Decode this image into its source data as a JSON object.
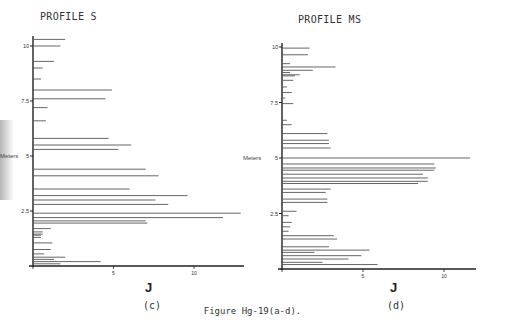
{
  "figure": {
    "caption": "Figure Hg-19(a-d).",
    "panels": [
      {
        "id": "c",
        "title": "PROFILE S",
        "sublabel": "(c)",
        "ylabel": "Meters",
        "xlabel": "J"
      },
      {
        "id": "d",
        "title": "PROFILE MS",
        "sublabel": "(d)",
        "ylabel": "Meters",
        "xlabel": "J"
      }
    ]
  },
  "chart_data": [
    {
      "type": "bar",
      "orientation": "horizontal",
      "title": "PROFILE S",
      "panel_label": "(c)",
      "xlabel": "J",
      "ylabel": "Meters",
      "xlim": [
        0,
        13
      ],
      "ylim": [
        0,
        10.5
      ],
      "xticks": [
        0,
        5,
        10
      ],
      "yticks": [
        2.5,
        5,
        7.5,
        10
      ],
      "grid": false,
      "depth_m": [
        10.3,
        10.0,
        9.3,
        9.0,
        8.5,
        8.0,
        7.6,
        7.2,
        6.6,
        5.8,
        5.5,
        5.3,
        4.4,
        4.1,
        3.5,
        3.2,
        3.0,
        2.8,
        2.4,
        2.2,
        2.05,
        1.95,
        1.7,
        1.55,
        1.45,
        1.4,
        1.3,
        1.05,
        0.75,
        0.55,
        0.4,
        0.3,
        0.2,
        0.1
      ],
      "values": [
        2.0,
        1.7,
        1.3,
        0.6,
        0.5,
        4.9,
        4.5,
        0.9,
        0.8,
        4.7,
        6.1,
        5.3,
        7.0,
        7.8,
        6.0,
        9.6,
        7.6,
        8.4,
        12.9,
        11.8,
        7.0,
        7.1,
        1.1,
        0.6,
        0.6,
        0.5,
        0.5,
        1.2,
        1.1,
        0.7,
        2.0,
        1.3,
        4.2,
        1.7
      ]
    },
    {
      "type": "bar",
      "orientation": "horizontal",
      "title": "PROFILE MS",
      "panel_label": "(d)",
      "xlabel": "J",
      "ylabel": "Meters",
      "xlim": [
        0,
        12
      ],
      "ylim": [
        0,
        10.2
      ],
      "xticks": [
        0,
        5,
        10
      ],
      "yticks": [
        2.5,
        5,
        7.5,
        10
      ],
      "grid": false,
      "depth_m": [
        9.95,
        9.65,
        9.25,
        9.1,
        8.95,
        8.85,
        8.75,
        8.7,
        8.5,
        8.2,
        7.95,
        7.7,
        7.45,
        6.7,
        6.5,
        6.1,
        5.8,
        5.65,
        5.45,
        5.0,
        4.73,
        4.55,
        4.45,
        4.27,
        4.1,
        3.95,
        3.85,
        3.6,
        3.45,
        3.15,
        3.0,
        2.6,
        2.4,
        2.1,
        1.9,
        1.7,
        1.5,
        1.35,
        1.0,
        0.85,
        0.75,
        0.6,
        0.45,
        0.3,
        0.2
      ],
      "values": [
        1.7,
        1.6,
        0.5,
        3.3,
        1.9,
        0.5,
        1.1,
        0.8,
        0.7,
        0.3,
        0.6,
        0.2,
        0.7,
        0.3,
        0.6,
        2.8,
        2.9,
        2.9,
        3.0,
        11.6,
        9.4,
        9.5,
        9.4,
        8.7,
        9.0,
        9.0,
        8.4,
        3.0,
        2.7,
        2.8,
        2.8,
        0.9,
        0.4,
        0.6,
        0.5,
        0.4,
        3.2,
        3.4,
        2.9,
        5.4,
        2.0,
        4.9,
        4.1,
        2.5,
        5.9
      ]
    }
  ]
}
